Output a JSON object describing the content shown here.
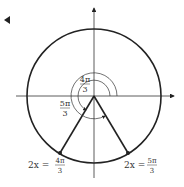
{
  "diagram": {
    "type": "unit-circle",
    "angles": [
      {
        "label_num": "4π",
        "label_den": "3",
        "role": "inner-arc-angle"
      },
      {
        "label_num": "5π",
        "label_den": "3",
        "role": "outer-arc-angle"
      }
    ],
    "points": [
      {
        "label_prefix": "2x =",
        "num": "4π",
        "den": "3"
      },
      {
        "label_prefix": "2x =",
        "num": "5π",
        "den": "3"
      }
    ],
    "colors": {
      "stroke": "#222222",
      "text": "#333333",
      "background": "#ffffff"
    }
  }
}
